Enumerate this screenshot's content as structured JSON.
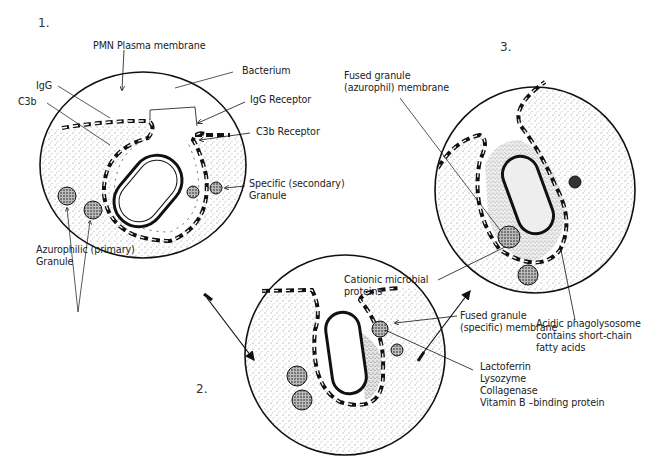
{
  "diagram": {
    "type": "phagocytosis-stages",
    "stages": [
      {
        "number": "1.",
        "labels": {
          "plasma_membrane": "PMN Plasma membrane",
          "igg": "IgG",
          "c3b": "C3b",
          "bacterium": "Bacterium",
          "igg_receptor": "IgG Receptor",
          "c3b_receptor": "C3b Receptor",
          "specific_granule_line1": "Specific (secondary)",
          "specific_granule_line2": "Granule",
          "azurophilic_line1": "Azurophilic (primary)",
          "azurophilic_line2": "Granule"
        }
      },
      {
        "number": "2.",
        "labels": {
          "fused_specific_line1": "Fused granule",
          "fused_specific_line2": "(specific) membrane",
          "contents": [
            "Lactoferrin",
            "Lysozyme",
            "Collagenase",
            "Vitamin B –binding protein"
          ]
        }
      },
      {
        "number": "3.",
        "labels": {
          "fused_azurophil_line1": "Fused granule",
          "fused_azurophil_line2": "(azurophil) membrane",
          "cationic_line1": "Cationic microbial",
          "cationic_line2": "proteins",
          "acidic_line1": "Acidic phagolysosome",
          "acidic_line2": "contains short-chain",
          "acidic_line3": "fatty acids"
        }
      }
    ],
    "colors": {
      "ink": "#111111",
      "background": "#ffffff",
      "stipple": "#555555"
    }
  }
}
